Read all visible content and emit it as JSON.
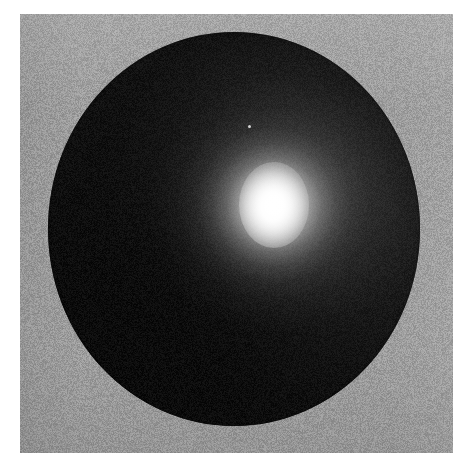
{
  "figure": {
    "title": "Shaded sphere with specular highlight",
    "media_type": "grayscale-raster-image",
    "canvas": {
      "width_px": 472,
      "height_px": 473,
      "page_background_color": "#ffffff"
    },
    "plate": {
      "label": "image plate",
      "left_px": 20,
      "top_px": 14,
      "width_px": 433,
      "height_px": 439,
      "background_color": "#9d9d9d",
      "texture": "scan-grain"
    },
    "subject": {
      "shape": "sphere",
      "label": "dark sphere",
      "center_x_px": 234,
      "center_y_px": 229,
      "radius_x_px": 186,
      "radius_y_px": 197,
      "base_color": "#060606",
      "terminator_color": "#2e2e2e",
      "limb_color": "#000000"
    },
    "highlight": {
      "label": "specular highlight",
      "center_x_px": 274,
      "center_y_px": 205,
      "core_color": "#ffffff",
      "falloff": "gaussian",
      "core_radius_px": 18,
      "glow_radius_px": 105
    },
    "artifacts": [
      {
        "label": "scan speck",
        "x_px": 248,
        "y_px": 125,
        "size_px": 3,
        "color": "#e8e8e8"
      }
    ]
  }
}
